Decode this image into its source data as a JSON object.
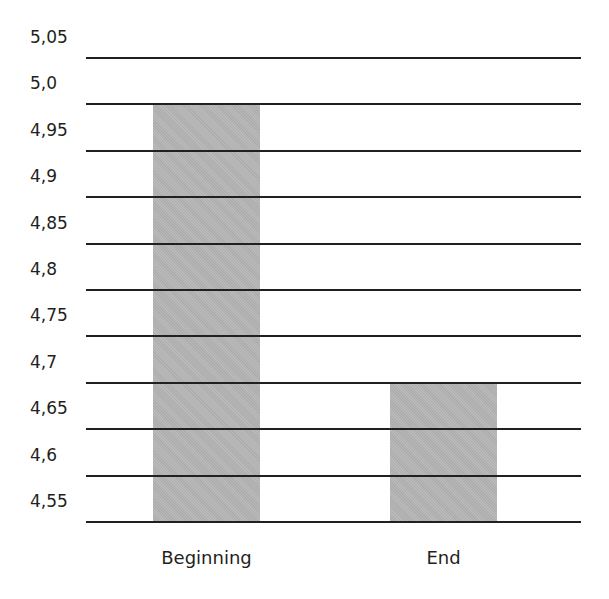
{
  "chart_data": {
    "type": "bar",
    "title": "",
    "xlabel": "",
    "ylabel": "",
    "categories": [
      "Beginning",
      "End"
    ],
    "values": [
      5.0,
      4.7
    ],
    "ylim": [
      4.55,
      5.05
    ],
    "y_ticks": [
      4.55,
      4.6,
      4.65,
      4.7,
      4.75,
      4.8,
      4.85,
      4.9,
      4.95,
      5.0,
      5.05
    ],
    "y_tick_labels": [
      "4,55",
      "4,6",
      "4,65",
      "4,7",
      "4,75",
      "4,8",
      "4,85",
      "4,9",
      "4,95",
      "5,0",
      "5,05"
    ],
    "grid": true,
    "legend": null,
    "bar_color": "#b6b6b6",
    "line_color": "#231f20"
  }
}
